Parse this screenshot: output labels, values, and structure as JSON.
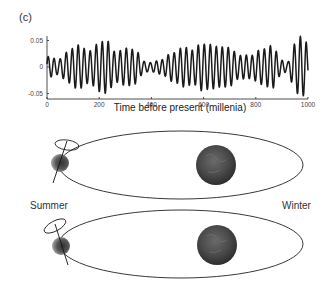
{
  "panel_label": "(c)",
  "chart_data": {
    "type": "line",
    "title": "",
    "xlabel": "Time before present (millenia)",
    "ylabel": "",
    "xlim": [
      0,
      1000
    ],
    "ylim": [
      -0.06,
      0.06
    ],
    "xticks": [
      "0",
      "200",
      "400",
      "600",
      "800",
      "1000"
    ],
    "yticks": [
      "0.05",
      "0",
      "-0.05"
    ],
    "grid": false,
    "series": [
      {
        "name": "eccentricity/precession signal",
        "period_kyr": 23,
        "envelope_x": [
          0,
          40,
          80,
          120,
          160,
          200,
          230,
          260,
          300,
          340,
          370,
          400,
          440,
          480,
          520,
          560,
          590,
          620,
          660,
          700,
          740,
          780,
          820,
          860,
          900,
          920,
          950,
          970,
          990,
          1000
        ],
        "envelope_amp": [
          0.018,
          0.015,
          0.03,
          0.04,
          0.032,
          0.046,
          0.048,
          0.03,
          0.036,
          0.03,
          0.012,
          0.01,
          0.012,
          0.028,
          0.038,
          0.03,
          0.046,
          0.044,
          0.036,
          0.038,
          0.022,
          0.02,
          0.035,
          0.04,
          0.012,
          0.01,
          0.045,
          0.057,
          0.05,
          0.03
        ]
      }
    ]
  },
  "diagram": {
    "summer_label": "Summer",
    "winter_label": "Winter",
    "orbits": [
      {
        "name": "orbit-top",
        "axis_tilt": "earth tilted, spin axis precession circle above"
      },
      {
        "name": "orbit-bottom",
        "axis_tilt": "earth tilted, precession circle shifted"
      }
    ]
  }
}
